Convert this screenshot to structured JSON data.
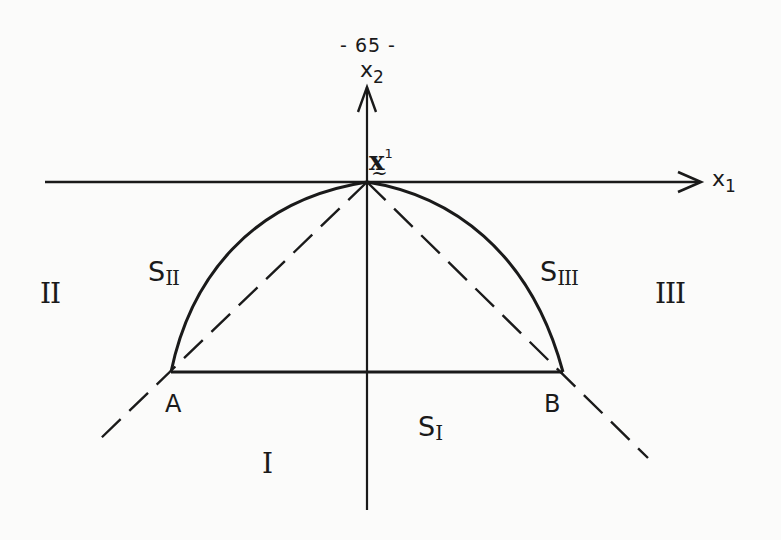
{
  "page": {
    "number_label": "- 65 -"
  },
  "axes": {
    "x1": {
      "name": "x",
      "sub": "1"
    },
    "x2": {
      "name": "x",
      "sub": "2"
    }
  },
  "origin_point": {
    "symbol": "x",
    "tilde": "~",
    "superscript": "1"
  },
  "points": {
    "A": "A",
    "B": "B"
  },
  "regions": {
    "I": "I",
    "II": "II",
    "III": "III"
  },
  "surfaces": {
    "S_I": {
      "letter": "S",
      "sub": "I"
    },
    "S_II": {
      "letter": "S",
      "sub": "II"
    },
    "S_III": {
      "letter": "S",
      "sub": "III"
    }
  },
  "geometry": {
    "origin": [
      367,
      182
    ],
    "point_A": [
      171,
      372
    ],
    "point_B": [
      563,
      372
    ],
    "x1_axis": {
      "from": [
        45,
        182
      ],
      "to": [
        700,
        182
      ]
    },
    "x2_axis": {
      "from": [
        367,
        510
      ],
      "to": [
        367,
        85
      ]
    },
    "dashed_left": {
      "from": [
        367,
        182
      ],
      "to": [
        98,
        441
      ]
    },
    "dashed_right": {
      "from": [
        367,
        182
      ],
      "to": [
        648,
        458
      ]
    },
    "chord_AB": {
      "from": [
        171,
        372
      ],
      "to": [
        563,
        372
      ]
    },
    "stroke_color": "#1a1a1a"
  }
}
